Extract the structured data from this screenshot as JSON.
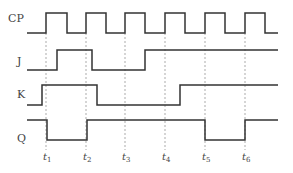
{
  "diagram": {
    "type": "timing-diagram",
    "signals": [
      {
        "name": "CP",
        "label_y": 18
      },
      {
        "name": "J",
        "label_y": 72
      },
      {
        "name": "K",
        "label_y": 96
      },
      {
        "name": "Q",
        "label_y": 130
      }
    ],
    "time_markers": [
      {
        "label": "t",
        "sub": "1"
      },
      {
        "label": "t",
        "sub": "2"
      },
      {
        "label": "t",
        "sub": "3"
      },
      {
        "label": "t",
        "sub": "4"
      },
      {
        "label": "t",
        "sub": "5"
      },
      {
        "label": "t",
        "sub": "6"
      }
    ]
  }
}
